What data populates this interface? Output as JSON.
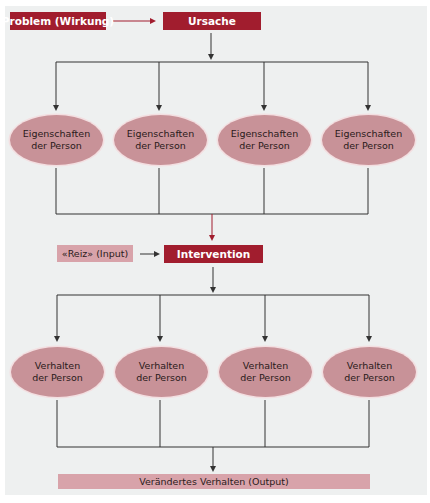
{
  "colors": {
    "panel_bg": "#eef0f0",
    "dark_box": "#a11d2e",
    "light_box": "#d8a3aa",
    "ellipse": "#c89298",
    "line": "#333333",
    "red_arrow": "#a11d2e"
  },
  "top_row": {
    "problem_label": "Problem (Wirkung)",
    "cause_label": "Ursache"
  },
  "traits": [
    {
      "line1": "Eigenschaften",
      "line2": "der Person"
    },
    {
      "line1": "Eigenschaften",
      "line2": "der Person"
    },
    {
      "line1": "Eigenschaften",
      "line2": "der Person"
    },
    {
      "line1": "Eigenschaften",
      "line2": "der Person"
    }
  ],
  "middle_row": {
    "stimulus_label": "«Reiz» (Input)",
    "intervention_label": "Intervention"
  },
  "behaviors": [
    {
      "line1": "Verhalten",
      "line2": "der Person"
    },
    {
      "line1": "Verhalten",
      "line2": "der Person"
    },
    {
      "line1": "Verhalten",
      "line2": "der Person"
    },
    {
      "line1": "Verhalten",
      "line2": "der Person"
    }
  ],
  "output": {
    "label": "Verändertes Verhalten (Output)"
  }
}
